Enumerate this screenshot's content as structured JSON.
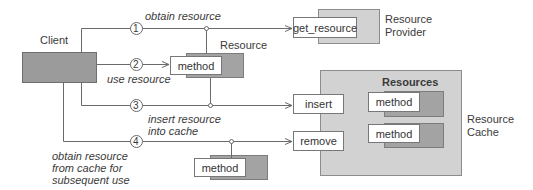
{
  "diagram": {
    "client": {
      "label": "Client"
    },
    "resource": {
      "label": "Resource",
      "method_label": "method"
    },
    "provider": {
      "label_line1": "Resource",
      "label_line2": "Provider",
      "operation": "get_resource"
    },
    "cache": {
      "label_line1": "Resource",
      "label_line2": "Cache",
      "group_title": "Resources",
      "operations": [
        "insert",
        "remove"
      ],
      "methods": [
        "method",
        "method"
      ]
    },
    "retrieved_resource": {
      "method_label": "method"
    },
    "steps": [
      {
        "number": "1",
        "text_lines": [
          "obtain resource"
        ]
      },
      {
        "number": "2",
        "text_lines": [
          "use resource"
        ]
      },
      {
        "number": "3",
        "text_lines": [
          "insert resource",
          "into cache"
        ]
      },
      {
        "number": "4",
        "text_lines": [
          "obtain resource",
          "from cache for",
          "subsequent use"
        ]
      }
    ],
    "colors": {
      "client_fill": "#9b9b9b",
      "container_fill": "#d2d2d2",
      "shadow_fill": "#a3a3a3",
      "line": "#6a6a6a"
    }
  }
}
